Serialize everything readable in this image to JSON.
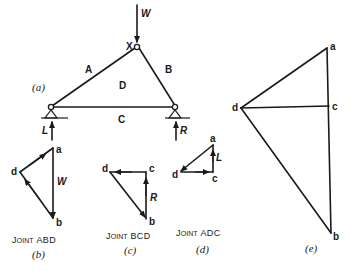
{
  "truss": {
    "figure_label": "(a)",
    "load_label": "W",
    "apex_label": "X",
    "spaces": {
      "A": "A",
      "B": "B",
      "C": "C",
      "D": "D"
    },
    "left_reaction": "L",
    "right_reaction": "R"
  },
  "joint_abd": {
    "caption_big": "J",
    "caption_small": "OINT",
    "caption_rest": "ABD",
    "figure_label": "(b)",
    "points": {
      "a": "a",
      "b": "b",
      "d": "d"
    },
    "force_label": "W"
  },
  "joint_bcd": {
    "caption_big": "J",
    "caption_small": "OINT",
    "caption_rest": "BCD",
    "figure_label": "(c)",
    "points": {
      "b": "b",
      "c": "c",
      "d": "d"
    },
    "force_label": "R"
  },
  "joint_adc": {
    "caption_big": "J",
    "caption_small": "OINT",
    "caption_rest": "ADC",
    "figure_label": "(d)",
    "points": {
      "a": "a",
      "c": "c",
      "d": "d"
    },
    "force_label": "L"
  },
  "force_polygon": {
    "figure_label": "(e)",
    "points": {
      "a": "a",
      "b": "b",
      "c": "c",
      "d": "d"
    }
  }
}
